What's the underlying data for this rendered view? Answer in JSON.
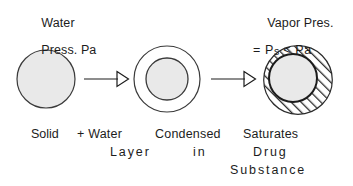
{
  "figure": {
    "background_color": "#ffffff",
    "ink_color": "#1c1c1c",
    "fill_gray": "#e9e9e9",
    "hatch_color": "#2a2a2a"
  },
  "labels": {
    "left": {
      "line1": "Water",
      "line2": "Press. Pa"
    },
    "right": {
      "line1": "Vapor Pres.",
      "line2_prefix": "= P",
      "line2_subscript": "s",
      "line2_suffix": " < Pa"
    }
  },
  "captions": {
    "row1": {
      "solid": "Solid",
      "plus_water": "+ Water",
      "condensed": "Condensed",
      "saturates": "Saturates"
    },
    "row2": {
      "layer": "Layer",
      "in": "in",
      "drug": "Drug"
    },
    "row3": {
      "substance": "Substance"
    }
  },
  "stages": [
    {
      "name": "solid-particle",
      "description": "Bare solid drug particle",
      "center": [
        46,
        79
      ],
      "radius": 29,
      "fill": "#e9e9e9",
      "stroke": "#3a3a3a",
      "hatched": false
    },
    {
      "name": "water-layer-particle",
      "description": "Solid particle surrounded by a condensed water layer",
      "outer": {
        "center": [
          167,
          79
        ],
        "radius": 33,
        "fill": "#ffffff",
        "stroke": "#3a3a3a"
      },
      "inner": {
        "center": [
          167,
          79
        ],
        "radius": 21,
        "fill": "#e9e9e9",
        "stroke": "#3a3a3a"
      },
      "hatched": false
    },
    {
      "name": "saturated-solution-particle",
      "description": "Solid particle in a saturated drug solution layer shown hatched",
      "outer": {
        "center": [
          298,
          80
        ],
        "radius": 35,
        "fill": "hatch",
        "stroke": "#2a2a2a"
      },
      "inner": {
        "center": [
          293,
          78
        ],
        "radius": 24,
        "fill": "#e9e9e9",
        "stroke": "#1c1c1c"
      },
      "hatched": true
    }
  ],
  "arrows": [
    {
      "name": "arrow-1",
      "from": [
        84,
        79
      ],
      "to": [
        127,
        79
      ],
      "style": "open-triangle-head"
    },
    {
      "name": "arrow-2",
      "from": [
        211,
        79
      ],
      "to": [
        254,
        79
      ],
      "style": "open-triangle-head"
    }
  ]
}
